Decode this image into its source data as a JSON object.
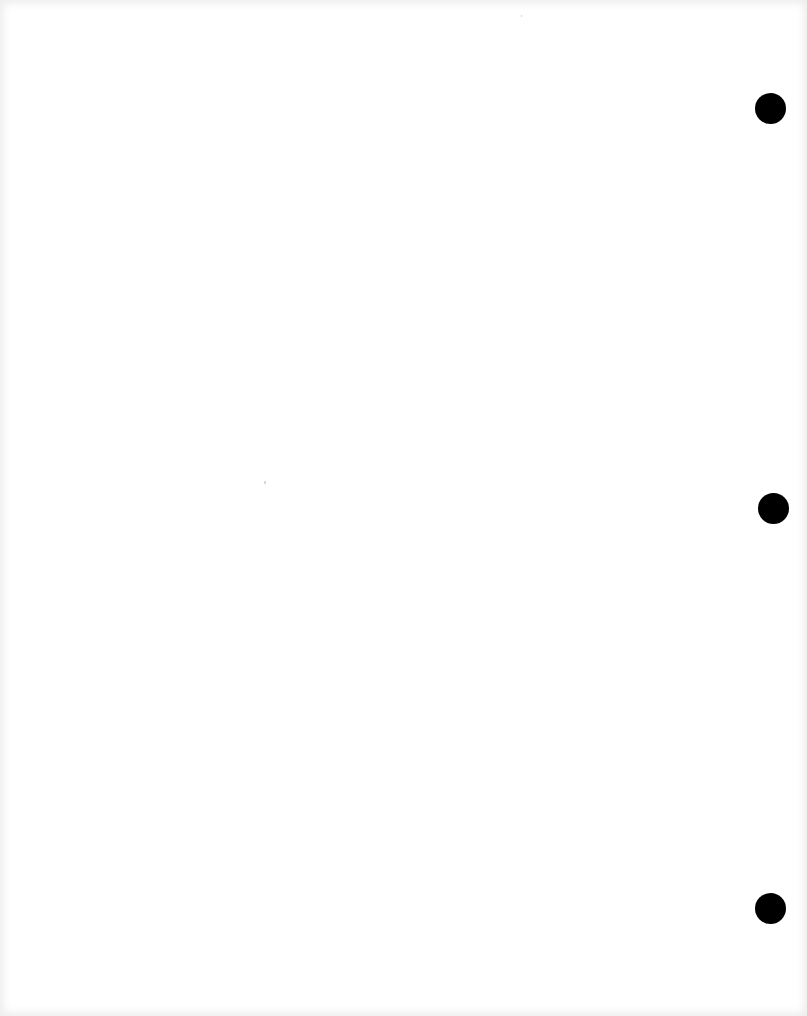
{
  "document": {
    "type": "blank three-hole-punched sheet",
    "text": "",
    "background_color": "#ffffff",
    "edge_color": "#ececec"
  },
  "punch_holes": [
    {
      "cx": 771,
      "cy": 109,
      "diameter": 31,
      "color": "#000000"
    },
    {
      "cx": 774,
      "cy": 509,
      "diameter": 31,
      "color": "#000000"
    },
    {
      "cx": 771,
      "cy": 909,
      "diameter": 31,
      "color": "#000000"
    }
  ]
}
